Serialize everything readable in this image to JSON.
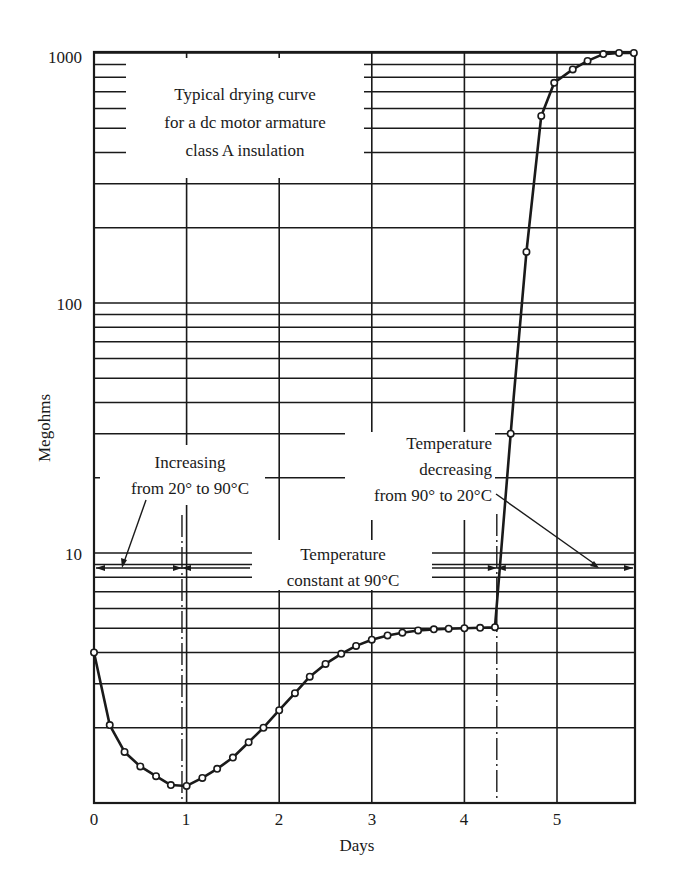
{
  "chart_data": {
    "type": "line",
    "title": "Typical drying curve for a dc motor armature class A insulation",
    "title_lines": [
      "Typical drying curve",
      "for a dc motor armature",
      "class A insulation"
    ],
    "xlabel": "Days",
    "ylabel": "Megohms",
    "xlim": [
      0,
      5.85
    ],
    "ylim": [
      1,
      1000
    ],
    "yscale": "log",
    "grid": true,
    "legend": null,
    "x_ticks": [
      0,
      1,
      2,
      3,
      4,
      5
    ],
    "x_tick_labels": [
      "0",
      "1",
      "2",
      "3",
      "4",
      "5"
    ],
    "y_ticks": [
      10,
      100,
      1000
    ],
    "y_tick_labels": [
      "10",
      "100",
      "1000"
    ],
    "series": [
      {
        "name": "Insulation resistance",
        "marker": "open-circle",
        "x": [
          0.0,
          0.17,
          0.33,
          0.5,
          0.67,
          0.83,
          1.0,
          1.17,
          1.33,
          1.5,
          1.67,
          1.83,
          2.0,
          2.17,
          2.33,
          2.5,
          2.67,
          2.83,
          3.0,
          3.17,
          3.33,
          3.5,
          3.67,
          3.83,
          4.0,
          4.17,
          4.33,
          4.5,
          4.67,
          4.83,
          4.97,
          5.17,
          5.33,
          5.5,
          5.67,
          5.83
        ],
        "values": [
          4.0,
          2.05,
          1.6,
          1.4,
          1.28,
          1.18,
          1.17,
          1.26,
          1.37,
          1.52,
          1.75,
          2.0,
          2.35,
          2.75,
          3.2,
          3.6,
          3.95,
          4.25,
          4.5,
          4.68,
          4.8,
          4.9,
          4.95,
          4.98,
          5.0,
          5.02,
          5.05,
          30,
          160,
          560,
          760,
          860,
          930,
          990,
          1000,
          1000
        ]
      }
    ],
    "annotations": [
      {
        "text_lines": [
          "Increasing",
          "from 20° to 90°C"
        ],
        "span_days": [
          0,
          0.95
        ]
      },
      {
        "text_lines": [
          "Temperature",
          "constant at 90°C"
        ],
        "span_days": [
          0.95,
          4.35
        ]
      },
      {
        "text_lines": [
          "Temperature",
          "decreasing",
          "from 90° to 20°C"
        ],
        "span_days": [
          4.35,
          5.85
        ]
      }
    ],
    "phase_boundaries_days": [
      0.95,
      4.35
    ]
  },
  "labels": {
    "title_line_1": "Typical drying curve",
    "title_line_2": "for a dc motor armature",
    "title_line_3": "class A insulation",
    "y_axis": "Megohms",
    "x_axis": "Days",
    "y_tick_1000": "1000",
    "y_tick_100": "100",
    "y_tick_10": "10",
    "x_tick_0": "0",
    "x_tick_1": "1",
    "x_tick_2": "2",
    "x_tick_3": "3",
    "x_tick_4": "4",
    "x_tick_5": "5",
    "phase1_line1": "Increasing",
    "phase1_line2": "from 20° to 90°C",
    "phase2_line1": "Temperature",
    "phase2_line2": "constant at 90°C",
    "phase3_line1": "Temperature",
    "phase3_line2": "decreasing",
    "phase3_line3": "from 90° to 20°C"
  },
  "colors": {
    "ink": "#1a1a1a",
    "background": "#ffffff"
  }
}
